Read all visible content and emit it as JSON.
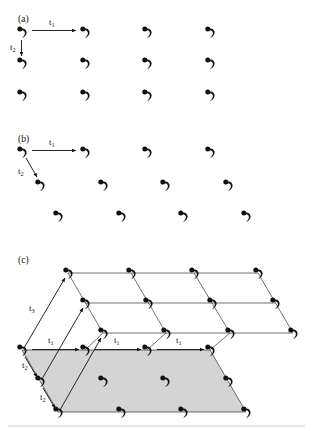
{
  "figure": {
    "title": "",
    "background_color": "#ffffff",
    "motif_color": "#111111",
    "plane_fill_color": "#d4d4d4",
    "lattice_line_color": "#333333",
    "arrow_color": "#111111",
    "motif_icon_name": "comma-spiral-motif",
    "panels": [
      {
        "id": "a",
        "label": "(a)",
        "label_x": 18,
        "label_y": 22,
        "description": "rectangular-2d-lattice",
        "vectors": [
          {
            "name": "t1",
            "label": "t",
            "subscript": "1",
            "label_x": 50,
            "label_y": 24,
            "x1": 32,
            "y1": 31,
            "x2": 77,
            "y2": 31
          },
          {
            "name": "t2",
            "label": "t",
            "subscript": "2",
            "label_x": 14,
            "label_y": 50,
            "x1": 22,
            "y1": 40,
            "x2": 22,
            "y2": 57
          }
        ],
        "motifs": [
          {
            "x": 22,
            "y": 32
          },
          {
            "x": 85,
            "y": 32
          },
          {
            "x": 147,
            "y": 32
          },
          {
            "x": 210,
            "y": 32
          },
          {
            "x": 22,
            "y": 63
          },
          {
            "x": 85,
            "y": 63
          },
          {
            "x": 147,
            "y": 63
          },
          {
            "x": 210,
            "y": 63
          },
          {
            "x": 22,
            "y": 95
          },
          {
            "x": 85,
            "y": 95
          },
          {
            "x": 147,
            "y": 95
          },
          {
            "x": 210,
            "y": 95
          }
        ]
      },
      {
        "id": "b",
        "label": "(b)",
        "label_x": 18,
        "label_y": 142,
        "description": "oblique-2d-lattice",
        "vectors": [
          {
            "name": "t1",
            "label": "t",
            "subscript": "1",
            "label_x": 50,
            "label_y": 144,
            "x1": 32,
            "y1": 151,
            "x2": 77,
            "y2": 151
          },
          {
            "name": "t2",
            "label": "t",
            "subscript": "2",
            "label_x": 22,
            "label_y": 173,
            "x1": 27,
            "y1": 159,
            "x2": 40,
            "y2": 177
          }
        ],
        "motifs": [
          {
            "x": 22,
            "y": 152
          },
          {
            "x": 85,
            "y": 152
          },
          {
            "x": 147,
            "y": 152
          },
          {
            "x": 210,
            "y": 152
          },
          {
            "x": 40,
            "y": 185
          },
          {
            "x": 103,
            "y": 185
          },
          {
            "x": 165,
            "y": 185
          },
          {
            "x": 228,
            "y": 185
          },
          {
            "x": 58,
            "y": 216
          },
          {
            "x": 121,
            "y": 216
          },
          {
            "x": 183,
            "y": 216
          },
          {
            "x": 246,
            "y": 216
          }
        ]
      },
      {
        "id": "c",
        "label": "(c)",
        "label_x": 18,
        "label_y": 263,
        "description": "three-dimensional-lattice-with-shaded-base-plane",
        "vectors": [
          {
            "name": "t3",
            "label": "t",
            "subscript": "3",
            "label_x": 33,
            "label_y": 308
          },
          {
            "name": "t1-lower-left",
            "label": "t",
            "subscript": "1",
            "label_x": 52,
            "label_y": 340
          },
          {
            "name": "t1-mid",
            "label": "t",
            "subscript": "1",
            "label_x": 118,
            "label_y": 341
          },
          {
            "name": "t1-right",
            "label": "t",
            "subscript": "1",
            "label_x": 180,
            "label_y": 341
          },
          {
            "name": "t2-upper",
            "label": "t",
            "subscript": "2",
            "label_x": 26,
            "label_y": 366
          },
          {
            "name": "t2-lower",
            "label": "t",
            "subscript": "2",
            "label_x": 45,
            "label_y": 399
          }
        ],
        "top_layer_rows": [
          {
            "y": 273,
            "xs": [
              68,
              131,
              194,
              258
            ]
          },
          {
            "y": 303,
            "xs": [
              85,
              148,
              212,
              275
            ]
          },
          {
            "y": 333,
            "xs": [
              103,
              166,
              230,
              293
            ]
          }
        ],
        "base_layer_rows": [
          {
            "y": 350,
            "xs": [
              22,
              85,
              147,
              210
            ]
          },
          {
            "y": 381,
            "xs": [
              40,
              103,
              165,
              228
            ]
          },
          {
            "y": 412,
            "xs": [
              58,
              121,
              183,
              246
            ]
          }
        ],
        "base_plane_polygon": "22,350 210,350 246,412 58,412"
      }
    ],
    "footer_rule": {
      "x1": 8,
      "y1": 426,
      "x2": 305,
      "y2": 426
    }
  }
}
